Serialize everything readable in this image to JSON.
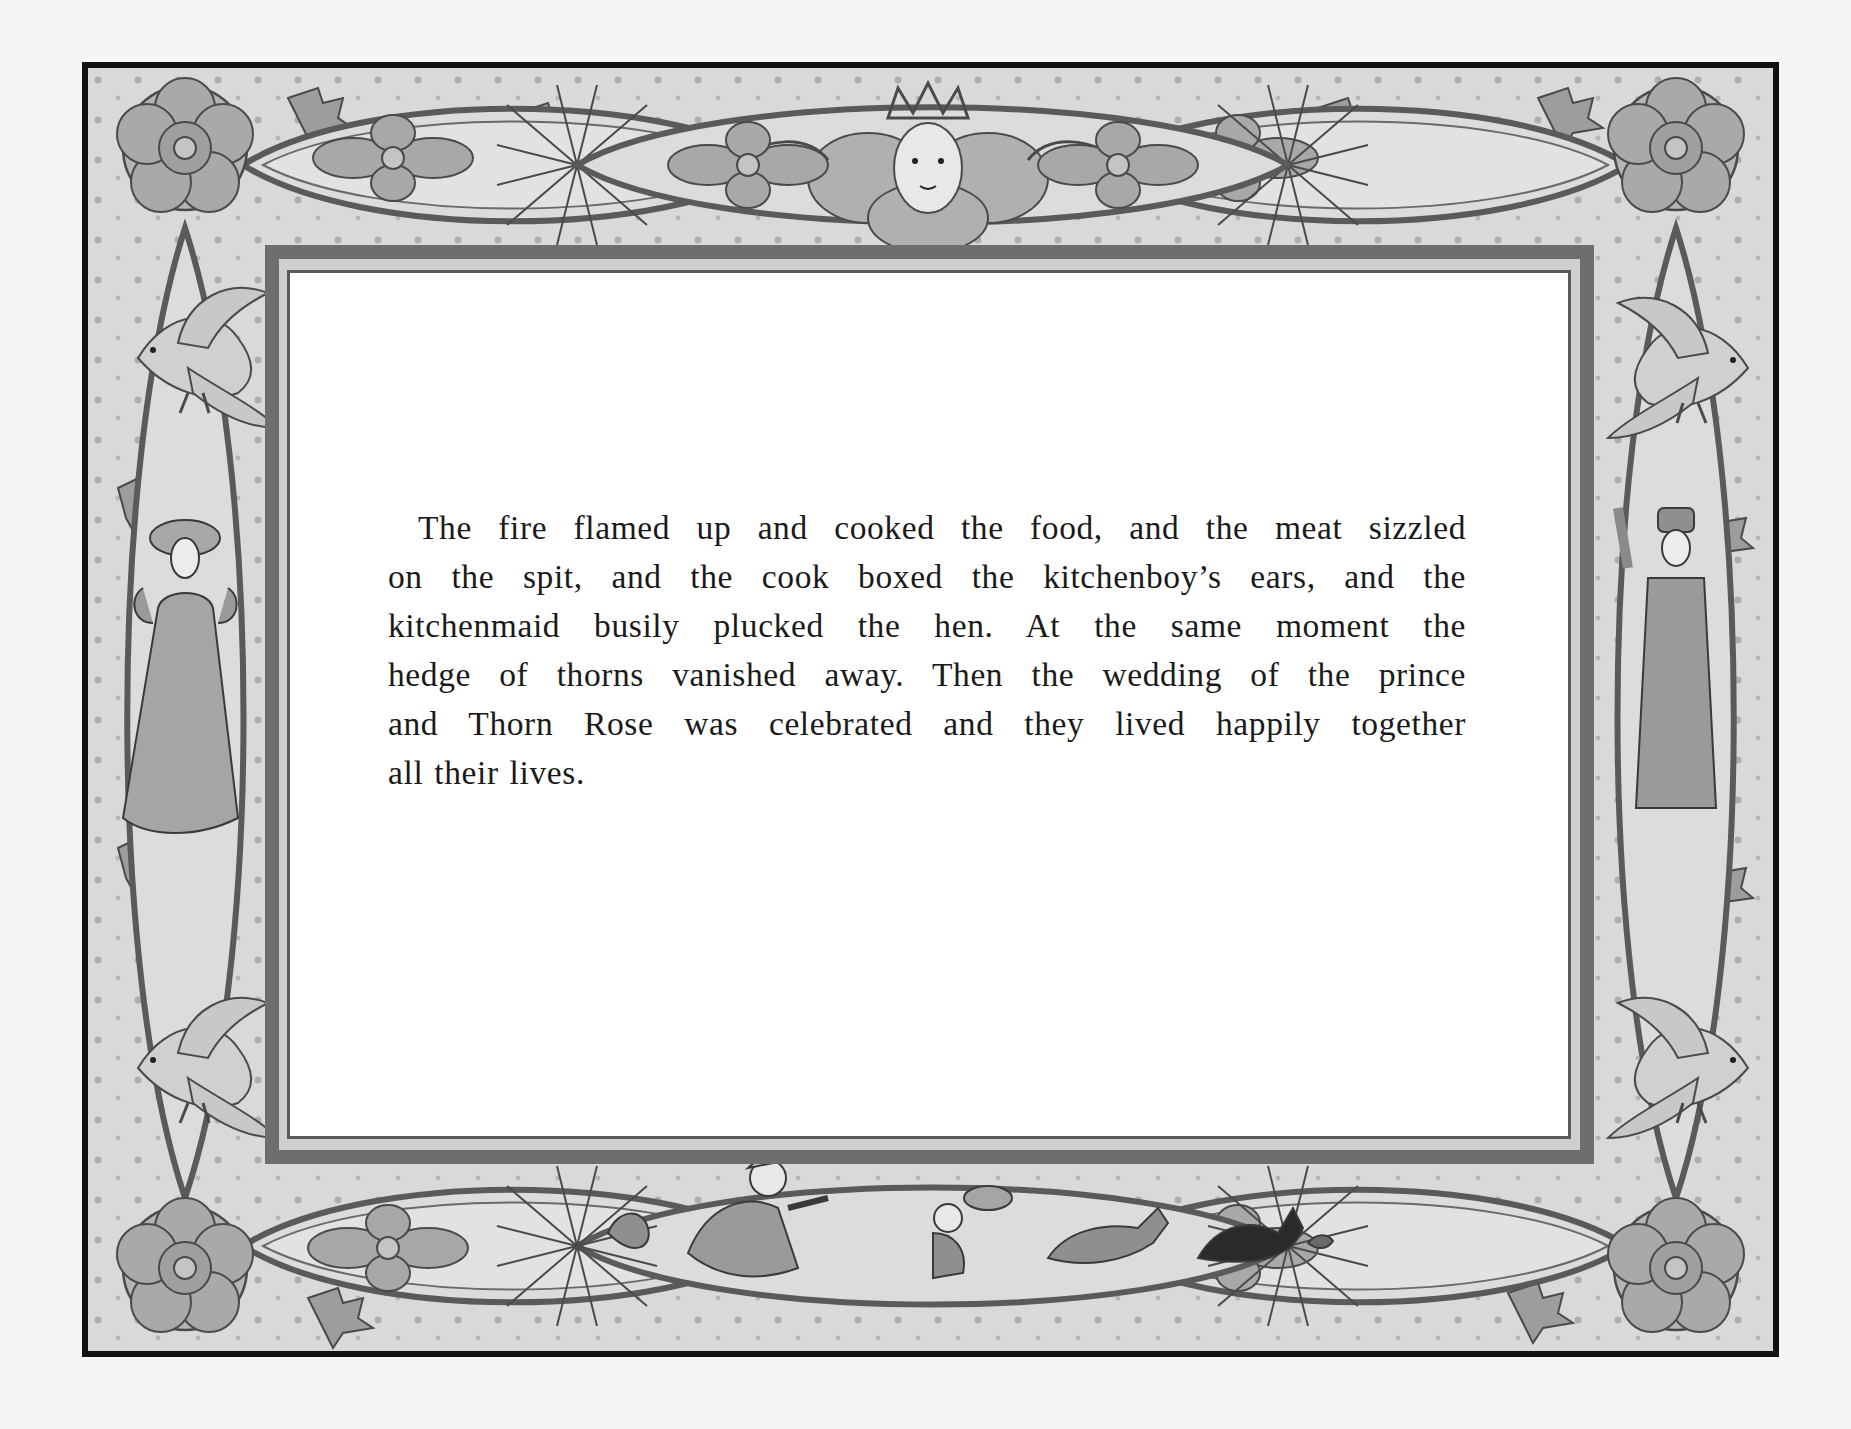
{
  "page": {
    "background_color": "#f5f5f4",
    "border_color": "#111111",
    "frame_band_color": "#6e6e6e",
    "ornament_fill": "#d9d9d7",
    "ornament_line": "#4a4a4a"
  },
  "story": {
    "lines": [
      "The fire flamed up and cooked the food, and the meat sizzled",
      "on the spit, and the cook boxed the kitchenboy’s ears, and the",
      "kitchenmaid busily plucked the hen. At the same moment the",
      "hedge of thorns vanished away. Then the wedding of the prince",
      "and Thorn Rose was celebrated and they lived happily together",
      "all their lives."
    ]
  },
  "illustrations": {
    "top_center": "crowned-face-in-flower",
    "top_left_cartouche": "flower-motif",
    "top_right_cartouche": "flower-motif",
    "corners": [
      "rose-top-left",
      "rose-top-right",
      "rose-bottom-left",
      "rose-bottom-right"
    ],
    "left_side": [
      "dove-upper-left",
      "yawning-woman",
      "dove-lower-left"
    ],
    "right_side": [
      "dove-upper-right",
      "yawning-man",
      "dove-lower-right"
    ],
    "bottom_scene": [
      "hen",
      "kitchenmaid-running",
      "kitchenboy-with-plate",
      "running-deer",
      "black-cat",
      "mouse"
    ]
  }
}
